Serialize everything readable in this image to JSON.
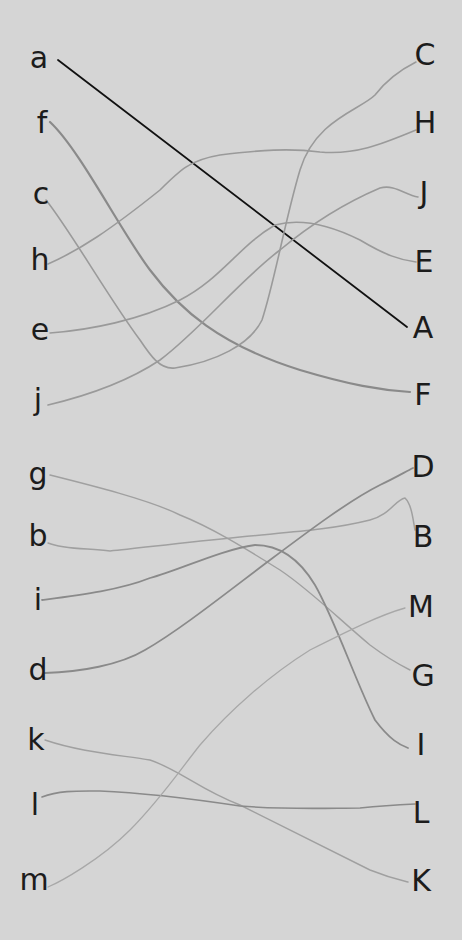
{
  "worksheet": {
    "title_fragment": "",
    "left_column": [
      {
        "label": "a",
        "x": 39,
        "y": 58
      },
      {
        "label": "f",
        "x": 42,
        "y": 123
      },
      {
        "label": "c",
        "x": 41,
        "y": 194
      },
      {
        "label": "h",
        "x": 40,
        "y": 260
      },
      {
        "label": "e",
        "x": 40,
        "y": 330
      },
      {
        "label": "j",
        "x": 38,
        "y": 400
      },
      {
        "label": "g",
        "x": 38,
        "y": 474
      },
      {
        "label": "b",
        "x": 38,
        "y": 536
      },
      {
        "label": "i",
        "x": 38,
        "y": 600
      },
      {
        "label": "d",
        "x": 38,
        "y": 670
      },
      {
        "label": "k",
        "x": 36,
        "y": 740
      },
      {
        "label": "l",
        "x": 35,
        "y": 805
      },
      {
        "label": "m",
        "x": 34,
        "y": 880
      }
    ],
    "right_column": [
      {
        "label": "C",
        "x": 425,
        "y": 55
      },
      {
        "label": "H",
        "x": 425,
        "y": 123
      },
      {
        "label": "J",
        "x": 424,
        "y": 193
      },
      {
        "label": "E",
        "x": 424,
        "y": 262
      },
      {
        "label": "A",
        "x": 423,
        "y": 328
      },
      {
        "label": "F",
        "x": 423,
        "y": 395
      },
      {
        "label": "D",
        "x": 423,
        "y": 467
      },
      {
        "label": "B",
        "x": 423,
        "y": 537
      },
      {
        "label": "M",
        "x": 421,
        "y": 607
      },
      {
        "label": "G",
        "x": 423,
        "y": 676
      },
      {
        "label": "I",
        "x": 421,
        "y": 745
      },
      {
        "label": "L",
        "x": 421,
        "y": 813
      },
      {
        "label": "K",
        "x": 421,
        "y": 881
      }
    ],
    "connections": [
      {
        "from": "a",
        "to": "A",
        "color": "#111111",
        "width": 1.8,
        "path": "M58 60 L407 327"
      },
      {
        "from": "f",
        "to": "F",
        "color": "#8a8a8a",
        "width": 2.2,
        "path": "M50 122 C80 150 120 230 150 270 C180 310 220 345 300 370 C350 385 380 390 410 392"
      },
      {
        "from": "c",
        "to": "C",
        "color": "#9a9a9a",
        "width": 1.6,
        "path": "M46 200 C70 230 110 300 140 340 C150 355 160 370 175 368 C215 362 250 345 262 320 C275 280 285 220 300 170 C315 120 360 110 375 95 C385 82 400 70 416 62"
      },
      {
        "from": "h",
        "to": "H",
        "color": "#9a9a9a",
        "width": 1.6,
        "path": "M48 264 C80 250 110 230 160 190 C180 170 190 160 220 155 C260 150 290 148 320 152 C355 155 380 145 416 130"
      },
      {
        "from": "e",
        "to": "E",
        "color": "#9a9a9a",
        "width": 1.6,
        "path": "M50 333 C90 330 140 320 180 300 C220 280 240 245 275 225 C300 218 330 225 360 240 C385 255 400 260 416 262"
      },
      {
        "from": "j",
        "to": "J",
        "color": "#9a9a9a",
        "width": 1.6,
        "path": "M48 405 C90 395 130 380 160 360 C200 330 240 280 280 250 C310 225 340 205 380 188 C395 184 405 195 418 197"
      },
      {
        "from": "g",
        "to": "G",
        "color": "#a0a0a0",
        "width": 1.4,
        "path": "M50 475 C90 485 150 500 180 515 C210 527 240 545 280 570 C310 590 340 620 370 645 C390 660 400 665 410 670"
      },
      {
        "from": "b",
        "to": "B",
        "color": "#a0a0a0",
        "width": 1.5,
        "path": "M48 543 C65 550 90 548 110 551 C140 548 180 543 240 537 C290 532 330 530 370 520 C390 515 395 500 405 498 C412 505 413 520 415 530"
      },
      {
        "from": "i",
        "to": "I",
        "color": "#8a8a8a",
        "width": 1.8,
        "path": "M42 600 C80 595 120 590 150 578 C180 570 220 550 255 545 C280 545 300 560 315 585 C335 620 355 680 375 720 C390 740 400 745 408 748"
      },
      {
        "from": "d",
        "to": "D",
        "color": "#8a8a8a",
        "width": 1.8,
        "path": "M45 673 C80 672 120 665 145 650 C180 630 230 590 270 560 C310 530 350 500 380 485 C395 478 405 472 413 468"
      },
      {
        "from": "k",
        "to": "K",
        "color": "#a0a0a0",
        "width": 1.4,
        "path": "M45 740 C80 752 120 755 150 760 C180 770 200 790 240 805 C290 830 330 850 370 870 C390 878 400 880 408 882"
      },
      {
        "from": "l",
        "to": "L",
        "color": "#8a8a8a",
        "width": 1.6,
        "path": "M42 797 C60 790 80 791 100 791 C150 793 200 800 240 806 C290 810 330 808 360 808 C380 806 395 805 415 804"
      },
      {
        "from": "m",
        "to": "M",
        "color": "#a8a8a8",
        "width": 1.3,
        "path": "M48 887 C60 882 100 860 130 830 C160 800 180 770 200 745 C230 710 270 675 310 650 C350 630 380 615 405 608"
      }
    ]
  }
}
